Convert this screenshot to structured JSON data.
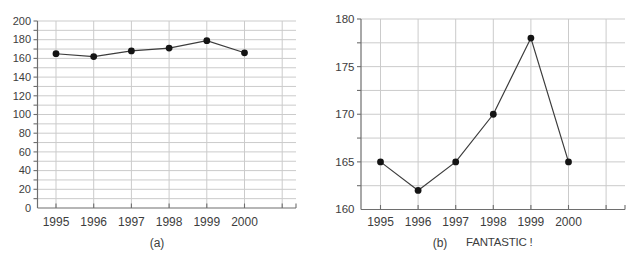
{
  "figure": {
    "background": "#ffffff"
  },
  "chart_data": [
    {
      "id": "a",
      "type": "line",
      "caption": "(a)",
      "categories": [
        "1995",
        "1996",
        "1997",
        "1998",
        "1999",
        "2000"
      ],
      "values": [
        165,
        162,
        168,
        171,
        179,
        166
      ],
      "xlabel": "",
      "ylabel": "",
      "ylim": [
        0,
        200
      ],
      "ytick_label_step": 20,
      "ytick_minor_step": 10,
      "ytick_labels": [
        "0",
        "20",
        "40",
        "60",
        "80",
        "100",
        "120",
        "140",
        "160",
        "180",
        "200"
      ],
      "grid": true,
      "legend": null,
      "marker": "filled-circle",
      "colors": {
        "grid": "#cbcbcb",
        "axis": "#6e6e6e",
        "line": "#3c3c3c",
        "marker": "#141414",
        "text": "#3d3d3d"
      }
    },
    {
      "id": "b",
      "type": "line",
      "caption": "(b)",
      "annotation": "FANTASTIC !",
      "categories": [
        "1995",
        "1996",
        "1997",
        "1998",
        "1999",
        "2000"
      ],
      "values": [
        165,
        162,
        165,
        170,
        178,
        165
      ],
      "xlabel": "",
      "ylabel": "",
      "ylim": [
        160,
        180
      ],
      "ytick_label_step": 5,
      "ytick_minor_step": 2.5,
      "ytick_labels": [
        "160",
        "165",
        "170",
        "175",
        "180"
      ],
      "grid": true,
      "legend": null,
      "marker": "filled-circle",
      "colors": {
        "grid": "#cbcbcb",
        "axis": "#6e6e6e",
        "line": "#3c3c3c",
        "marker": "#141414",
        "text": "#3d3d3d"
      }
    }
  ]
}
